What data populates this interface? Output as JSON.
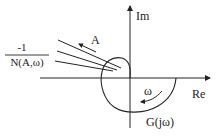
{
  "diagram": {
    "type": "nyquist-describing-function-plot",
    "axes": {
      "real_label": "Re",
      "imag_label": "Im"
    },
    "curves": {
      "plant_label": "G(jω)",
      "frequency_direction_label": "ω",
      "describing_function_label": {
        "numerator": "-1",
        "denominator": "N(A,ω)"
      },
      "amplitude_direction_label": "A"
    },
    "colors": {
      "stroke": "#222222",
      "background": "#ffffff"
    }
  }
}
